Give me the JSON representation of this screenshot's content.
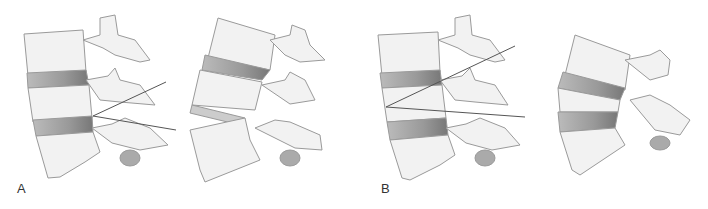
{
  "figure": {
    "panels": [
      {
        "label": "A",
        "description": "Lumbar spine segment with angle lines at lower disc; adjacent view shows wedged disc space"
      },
      {
        "label": "B",
        "description": "Lumbar spine segment with angle lines spanning upper vertebra; adjacent view shows fan-shaped disc spaces"
      }
    ],
    "colors": {
      "bone_fill": "#f2f2f2",
      "bone_stroke": "#9a9a9a",
      "disc_fill": "#9e9e9e",
      "line": "#555555"
    }
  }
}
